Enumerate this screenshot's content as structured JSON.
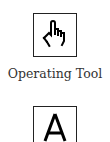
{
  "tools": [
    {
      "name": "Operating Tool",
      "icon": "pointing-hand-icon"
    },
    {
      "name": "",
      "icon": "labeling-tool-a-icon"
    }
  ]
}
